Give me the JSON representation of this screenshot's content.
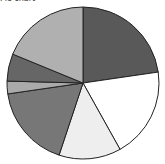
{
  "chart_data": {
    "type": "pie",
    "title": "Pie chart",
    "start_angle": "12 o'clock, clockwise",
    "slices": [
      {
        "label": "Slice 1",
        "value": 22.7,
        "color": "#595959"
      },
      {
        "label": "Slice 2",
        "value": 19.2,
        "color": "#ffffff"
      },
      {
        "label": "Slice 3",
        "value": 13.2,
        "color": "#eeeeee"
      },
      {
        "label": "Slice 4",
        "value": 17.6,
        "color": "#777777"
      },
      {
        "label": "Slice 5",
        "value": 2.7,
        "color": "#aaaaaa"
      },
      {
        "label": "Slice 6",
        "value": 5.8,
        "color": "#666666"
      },
      {
        "label": "Slice 7",
        "value": 18.8,
        "color": "#b0b0b0"
      }
    ],
    "legend": "none",
    "data_labels": "none"
  }
}
